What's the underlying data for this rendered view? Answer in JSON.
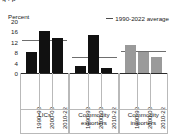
{
  "figure": {
    "title_fragment": "g .  p",
    "unit_label": "Percent",
    "legend": {
      "marker": "average-line-swatch",
      "label": "1990-2022 average"
    }
  },
  "chart_data": {
    "type": "bar",
    "title": "",
    "xlabel": "",
    "ylabel": "Percent",
    "ylim": [
      0,
      20
    ],
    "yticks": [
      "20",
      "16",
      "12",
      "8",
      "4",
      "0"
    ],
    "ytick_values": [
      20,
      16,
      12,
      8,
      4,
      0
    ],
    "grid": false,
    "legend_position": "top-right",
    "categories": [
      "1990-99",
      "2000-09",
      "2010-22"
    ],
    "groups": [
      {
        "name": "LICs",
        "color": "#111111",
        "values": [
          8.2,
          16.3,
          13.5
        ],
        "average": 12.6,
        "average_label": "1990-2022 average"
      },
      {
        "name": "Commodity exporters",
        "name_line1": "Commodity",
        "name_line2": "exporters",
        "color": "#111111",
        "values": [
          2.8,
          14.7,
          1.8
        ],
        "average": 6.3,
        "average_label": "1990-2022 average"
      },
      {
        "name": "Commodity importers",
        "name_line1": "Commodity",
        "name_line2": "importers",
        "color": "#9a9a9a",
        "values": [
          10.8,
          8.2,
          6.2
        ],
        "average": 8.3,
        "average_label": "1990-2022 average"
      }
    ]
  },
  "colors": {
    "bar_dark": "#111111",
    "bar_gray": "#9a9a9a",
    "average_line": "#6e6e6e",
    "axis": "#2b2b2b",
    "panel_border": "#b9b9b9",
    "background": "#ffffff"
  }
}
